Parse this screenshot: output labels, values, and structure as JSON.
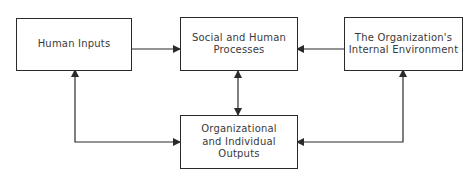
{
  "diagram": {
    "nodes": {
      "human_inputs": {
        "label": "Human Inputs"
      },
      "social_processes": {
        "label": "Social and Human\nProcesses"
      },
      "internal_environment": {
        "label": "The Organization's\nInternal Environment"
      },
      "outputs": {
        "label": "Organizational\nand Individual\nOutputs"
      }
    },
    "edges": [
      {
        "from": "human_inputs",
        "to": "social_processes",
        "direction": "one-way"
      },
      {
        "from": "internal_environment",
        "to": "social_processes",
        "direction": "one-way"
      },
      {
        "from": "social_processes",
        "to": "outputs",
        "direction": "two-way"
      },
      {
        "from": "human_inputs",
        "to": "outputs",
        "direction": "two-way"
      },
      {
        "from": "internal_environment",
        "to": "outputs",
        "direction": "two-way"
      }
    ],
    "line_color": "#2a2a2a"
  }
}
